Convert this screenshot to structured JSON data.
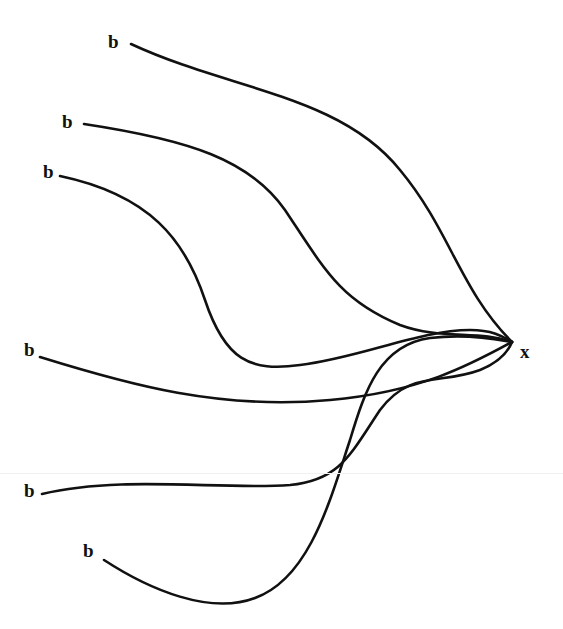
{
  "diagram": {
    "type": "many-to-one curve diagram",
    "target_node": {
      "label": "x",
      "x": 520,
      "y": 345
    },
    "source_nodes": [
      {
        "label": "b",
        "x": 108,
        "y": 32
      },
      {
        "label": "b",
        "x": 62,
        "y": 112
      },
      {
        "label": "b",
        "x": 43,
        "y": 162
      },
      {
        "label": "b",
        "x": 24,
        "y": 340
      },
      {
        "label": "b",
        "x": 24,
        "y": 481
      },
      {
        "label": "b",
        "x": 83,
        "y": 541
      }
    ],
    "edges": [
      {
        "from": 0,
        "to": "x",
        "path": "M131,44 C230,90 340,95 400,170 C450,230 460,290 512,342"
      },
      {
        "from": 1,
        "to": "x",
        "path": "M84,124 C190,140 250,160 285,210 C325,270 340,300 400,325 C440,340 480,330 512,342"
      },
      {
        "from": 2,
        "to": "x",
        "path": "M60,176 C150,195 185,240 205,300 C225,360 250,372 300,365 C360,358 420,330 470,330 C495,330 505,338 512,342"
      },
      {
        "from": 3,
        "to": "x",
        "path": "M40,357 C130,385 220,410 330,400 C420,392 470,365 512,342"
      },
      {
        "from": 4,
        "to": "x",
        "path": "M42,494 C120,475 220,490 290,485 C340,480 350,455 380,410 C410,370 440,385 480,370 C500,362 508,352 512,342"
      },
      {
        "from": 5,
        "to": "x",
        "path": "M104,560 C150,590 210,615 255,598 C310,578 330,500 350,440 C365,390 380,345 430,338 C470,333 500,340 512,342"
      }
    ]
  }
}
